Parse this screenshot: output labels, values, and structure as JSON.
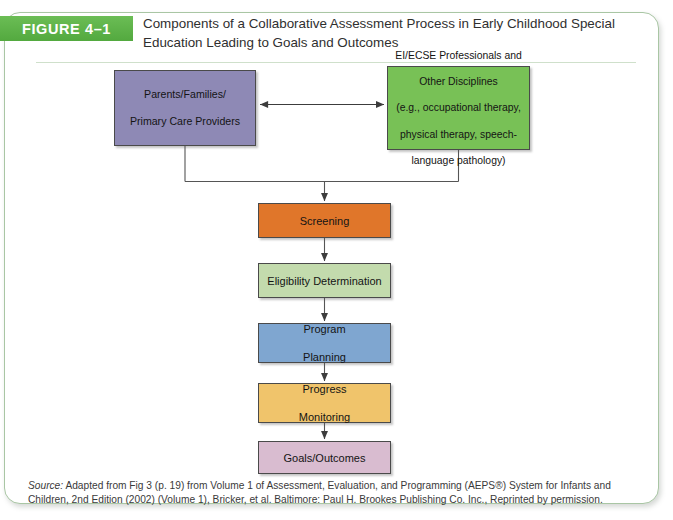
{
  "figure": {
    "badge_label": "FIGURE 4–1",
    "title": "Components of a Collaborative Assessment Process in Early Childhood Special Education Leading to Goals and Outcomes",
    "accent_color": "#5cb14a",
    "frame_border_color": "#a9c6a4"
  },
  "diagram": {
    "type": "flowchart",
    "nodes": [
      {
        "id": "parents",
        "label": "Parents/Families/\nPrimary Care Providers",
        "line1": "Parents/Families/",
        "line2": "Primary Care Providers",
        "fill": "#8e89b5"
      },
      {
        "id": "professionals",
        "label": "EI/ECSE Professionals and Other Disciplines (e.g., occupational therapy, physical therapy, speech-language pathology)",
        "line1": "EI/ECSE Professionals and",
        "line2": "Other Disciplines",
        "line3": "(e.g., occupational therapy,",
        "line4": "physical therapy, speech-",
        "line5": "language pathology)",
        "fill": "#78c156"
      },
      {
        "id": "screening",
        "label": "Screening",
        "fill": "#e0762a"
      },
      {
        "id": "eligibility",
        "label": "Eligibility Determination",
        "fill": "#c3dbad"
      },
      {
        "id": "program",
        "label": "Program Planning",
        "line1": "Program",
        "line2": "Planning",
        "fill": "#7fa6d0"
      },
      {
        "id": "progress",
        "label": "Progress Monitoring",
        "line1": "Progress",
        "line2": "Monitoring",
        "fill": "#f0c46b"
      },
      {
        "id": "goals",
        "label": "Goals/Outcomes",
        "fill": "#d9bcd0"
      }
    ],
    "edges": [
      {
        "from": "parents",
        "to": "professionals",
        "style": "double-headed-arrow"
      },
      {
        "from": "parents",
        "to": "screening",
        "style": "elbow-arrow"
      },
      {
        "from": "professionals",
        "to": "screening",
        "style": "elbow-arrow"
      },
      {
        "from": "screening",
        "to": "eligibility",
        "style": "arrow"
      },
      {
        "from": "eligibility",
        "to": "program",
        "style": "arrow"
      },
      {
        "from": "program",
        "to": "progress",
        "style": "arrow"
      },
      {
        "from": "progress",
        "to": "goals",
        "style": "arrow"
      }
    ]
  },
  "source": {
    "label": "Source:",
    "text": " Adapted from Fig 3 (p. 19) from Volume 1 of Assessment, Evaluation, and Programming (AEPS®) System for Infants and Children, 2nd Edition (2002) (Volume 1), Bricker, et al. Baltimore: Paul H. Brookes Publishing Co. Inc., Reprinted by permission."
  }
}
